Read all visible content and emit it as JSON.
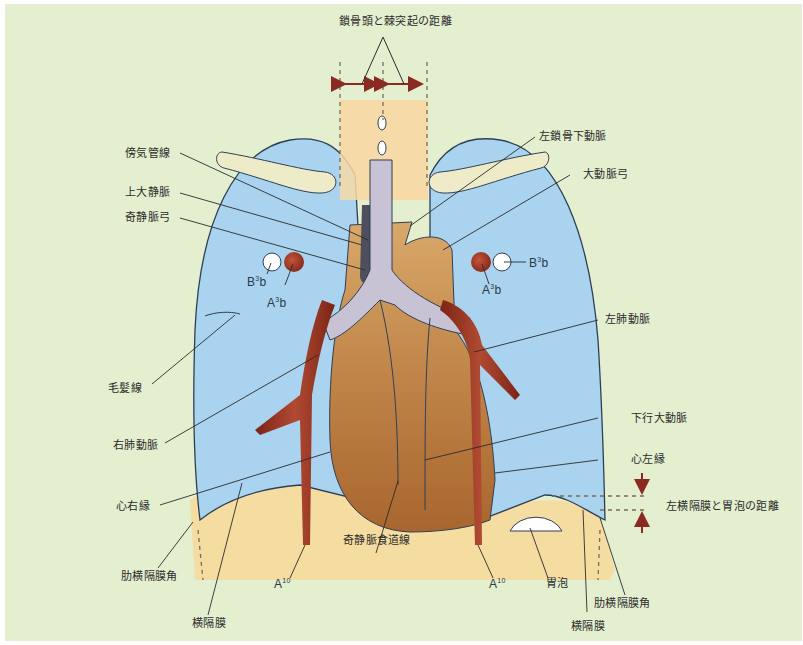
{
  "diagram": {
    "title": "鎖骨頭と棘突起の距離",
    "labels": {
      "paratracheal_line": "傍気管線",
      "svc": "上大静脈",
      "azygos_arch": "奇静脈弓",
      "left_subclavian": "左鎖骨下動脈",
      "aortic_arch": "大動脈弓",
      "b3b_right": "B",
      "b3b_left": "B",
      "a3b_right": "A",
      "a3b_left": "A",
      "b_sup": "3",
      "b_tail": "b",
      "a_sup": "3",
      "a_tail": "b",
      "left_pulmonary_artery": "左肺動脈",
      "minor_fissure": "毛髪線",
      "right_pulmonary_artery": "右肺動脈",
      "descending_aorta": "下行大動脈",
      "left_heart_border": "心左縁",
      "right_heart_border": "心右縁",
      "diaphragm_gastric_distance": "左横隔膜と胃泡の距離",
      "azygoesophageal_line": "奇静脈食道線",
      "costophrenic_angle_right": "肋横隔膜角",
      "costophrenic_angle_left": "肋横隔膜角",
      "diaphragm_right": "横隔膜",
      "diaphragm_left": "横隔膜",
      "a10_right": "A",
      "a10_left": "A",
      "a10_sup": "10",
      "gastric_bubble": "胃泡"
    },
    "colors": {
      "background": "#e3efcf",
      "lung": "#a9d3ee",
      "clavicle": "#eeecc8",
      "trachea": "#c8c3d4",
      "heart": "#b5773f",
      "vessels": "#8f2e1e",
      "abdomen": "#f5dca0",
      "spine": "#f6d9a6",
      "arrow": "#8b2a22",
      "outline": "#2e3f55"
    }
  }
}
